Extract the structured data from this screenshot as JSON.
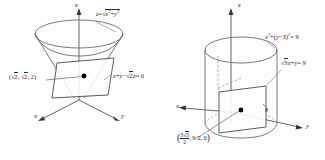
{
  "figure_left": {
    "name": "cone-and-plane",
    "axes": {
      "x": "x",
      "y": "y",
      "z": "z"
    },
    "surface_equation": "z = √(x² + y²)",
    "plane_equation": "x + y − √2 z = 0",
    "point_label": "(√2, √2, 2)",
    "surface_parts": {
      "lhs": "z",
      "eq": "=",
      "radicand_x": "x",
      "radicand_sup": "2",
      "radicand_plus": "+",
      "radicand_y": "y",
      "radicand_y_sup": "2"
    },
    "plane_parts": {
      "x": "x",
      "plus": "+",
      "y": "y",
      "minus": "−",
      "sqrt2z": "2",
      "z": "z",
      "eq0": "= 0"
    },
    "point_parts": {
      "open": "(",
      "a": "2",
      "b": "2",
      "c": "2",
      "close": ")"
    }
  },
  "figure_right": {
    "name": "cylinder-and-plane",
    "axes": {
      "x": "x",
      "y": "y",
      "z": "z"
    },
    "surface_equation": "x² + (y − 3)² = 9",
    "plane_equation": "√3 x + y = 9",
    "point_label": "(3√3/2, 9/2, 0)",
    "angle_label": "θ",
    "surface_parts": {
      "x": "x",
      "xsup": "2",
      "plus": "+",
      "open": "(",
      "y": "y",
      "minus": "−",
      "three": "3",
      "close": ")",
      "csup": "2",
      "eq9": "= 9"
    },
    "plane_parts": {
      "three": "3",
      "x": "x",
      "plus": "+",
      "y": "y",
      "eq9": "= 9"
    },
    "point_parts": {
      "num_three": "3",
      "num_rad": "3",
      "den": "2",
      "second": "9/2",
      "third": "0"
    }
  },
  "colors": {
    "background": "#fdfdfd",
    "ink": "#2b2b2b",
    "line": "#555555",
    "dashed": "#777777",
    "dot": "#000000"
  }
}
